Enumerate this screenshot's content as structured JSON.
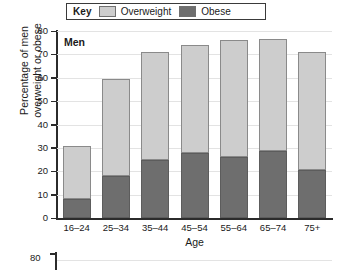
{
  "legend": {
    "key_label": "Key",
    "entries": [
      {
        "label": "Overweight",
        "color": "#cdcdcd",
        "name": "overweight"
      },
      {
        "label": "Obese",
        "color": "#6e6e6e",
        "name": "obese"
      }
    ]
  },
  "panel": {
    "label": "Men"
  },
  "next_chart": {
    "ytick_label": "80"
  },
  "chart_data": {
    "type": "bar",
    "subtype": "stacked-bar",
    "title": "",
    "panel_label": "Men",
    "xlabel": "Age",
    "ylabel": "Percentage of men overweight or obese",
    "ylabel_line1": "Percentage of men",
    "ylabel_line2": "overweight or obese",
    "categories": [
      "16–24",
      "25–34",
      "35–44",
      "45–54",
      "55–64",
      "65–74",
      "75+"
    ],
    "series": [
      {
        "name": "Obese",
        "color": "#6e6e6e",
        "values": [
          8,
          18,
          25,
          28,
          26,
          28.5,
          20.5
        ]
      },
      {
        "name": "Overweight",
        "color": "#cdcdcd",
        "values": [
          23,
          41.5,
          46,
          46,
          50,
          48,
          50.5
        ]
      }
    ],
    "totals": [
      31,
      59.5,
      71,
      74,
      76,
      76.5,
      71
    ],
    "ylim": [
      0,
      80
    ],
    "yticks": [
      0,
      10,
      20,
      30,
      40,
      50,
      60,
      70,
      80
    ],
    "ytick_labels": [
      "0",
      "10",
      "20",
      "30",
      "40",
      "50",
      "60",
      "70",
      "80"
    ],
    "grid": true,
    "grid_axis": "y",
    "legend_position": "top",
    "stack_order": [
      "Obese",
      "Overweight"
    ]
  }
}
